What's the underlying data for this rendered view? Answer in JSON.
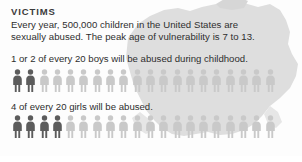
{
  "page": {
    "title": "VICTIMS",
    "intro_line_1": "Every year, 500,000 children in the United States are",
    "intro_line_2": "sexually abused. The peak age of vulnerability is 7 to 13."
  },
  "colors": {
    "title": "#3b3b3b",
    "body_text": "#2e2e2e",
    "figure_highlight": "#5c5c5c",
    "figure_muted": "#c9c9c9",
    "map_watermark": "#dcdcdc",
    "background": "#fdfdfd"
  },
  "stats": {
    "boys": {
      "caption": "1 or 2 of every 20 boys will be abused during childhood.",
      "total_figures": 20,
      "highlighted_figures": 2,
      "highlighted_label": "1 or 2",
      "denominator_label": "20",
      "group": "boys"
    },
    "girls": {
      "caption": "4 of every 20 girls will be abused.",
      "total_figures": 20,
      "highlighted_figures": 4,
      "highlighted_label": "4",
      "denominator_label": "20",
      "group": "girls"
    }
  },
  "icons": {
    "person": "person-figure-icon",
    "map": "us-map-watermark-icon"
  },
  "chart_data": {
    "type": "bar",
    "title": "VICTIMS",
    "subtitle": "Every year, 500,000 children in the United States are sexually abused. The peak age of vulnerability is 7 to 13.",
    "xlabel": "",
    "ylabel": "",
    "categories": [
      "boys",
      "girls"
    ],
    "series": [
      {
        "name": "Abused per 20 children",
        "values": [
          2,
          4
        ]
      },
      {
        "name": "Not abused per 20 children",
        "values": [
          18,
          16
        ]
      }
    ],
    "annotations": [
      "1 or 2 of every 20 boys will be abused during childhood.",
      "4 of every 20 girls will be abused."
    ],
    "ylim": [
      0,
      20
    ],
    "grid": false,
    "legend": "none",
    "note": "Pictogram/isotype chart: each icon represents 1 of 20 children; dark icons are victims."
  }
}
